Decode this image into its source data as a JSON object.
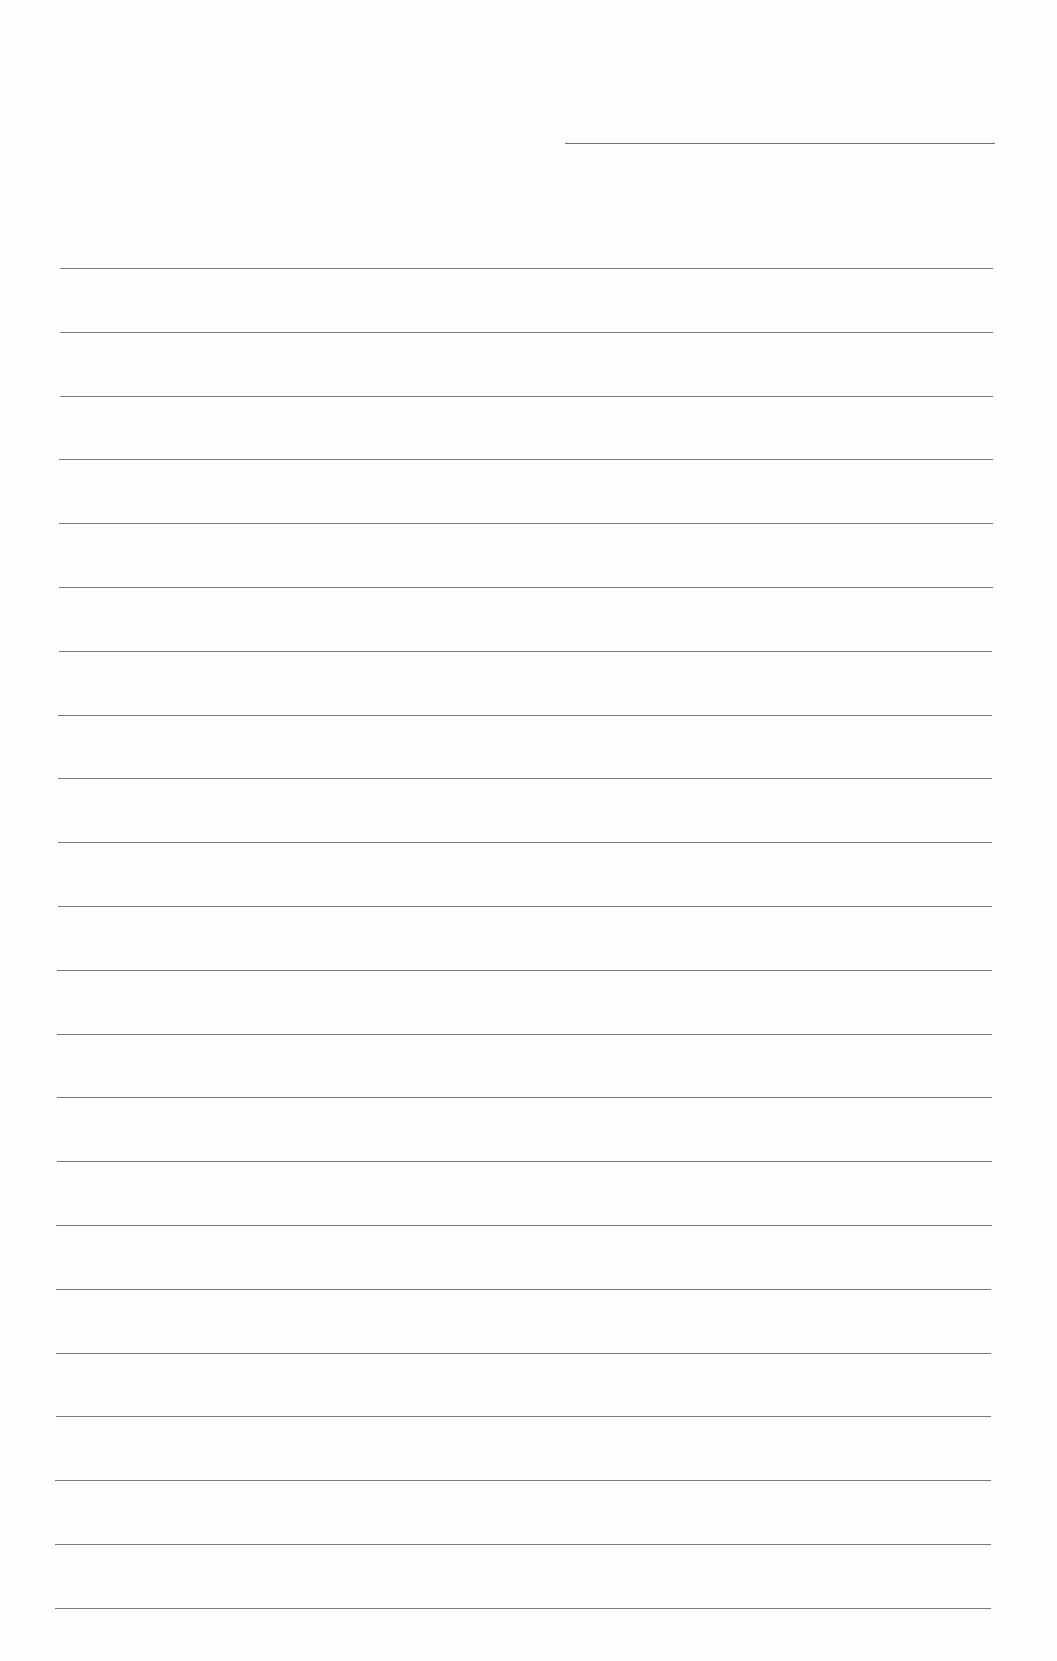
{
  "page": {
    "type": "blank lined paper",
    "background": "#fefefe",
    "line_color": "#777777"
  },
  "header_field": {
    "label": "",
    "value": ""
  },
  "ruled_lines": {
    "count": 22,
    "first_y": 268,
    "spacing": 63.8,
    "left_start": 60,
    "left_end": 55,
    "right_start": 993,
    "right_end": 991,
    "lines": [
      "",
      "",
      "",
      "",
      "",
      "",
      "",
      "",
      "",
      "",
      "",
      "",
      "",
      "",
      "",
      "",
      "",
      "",
      "",
      "",
      "",
      ""
    ]
  }
}
